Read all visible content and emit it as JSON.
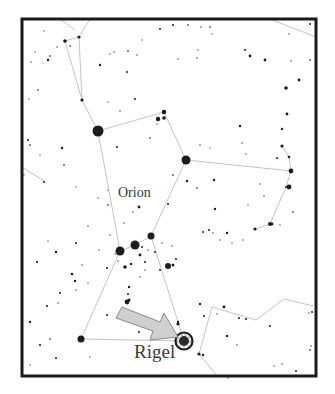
{
  "chart": {
    "constellation_label": "Orion",
    "highlight_label": "Rigel",
    "frame": {
      "x": 22,
      "y": 19,
      "width": 294,
      "height": 357,
      "stroke": "#1a1a1a",
      "stroke_width": 3
    },
    "colors": {
      "background": "#ffffff",
      "star": "#1c1c1c",
      "line": "#c4c4c4",
      "arrow_fill": "#cfcfcf",
      "arrow_stroke": "#8a8a8a",
      "label": "#3a3a3a"
    },
    "named_stars": [
      {
        "name": "Betelgeuse",
        "x": 98,
        "y": 131,
        "r": 5.5
      },
      {
        "name": "Bellatrix",
        "x": 186,
        "y": 160,
        "r": 4.5
      },
      {
        "name": "Meissa",
        "x": 164,
        "y": 112,
        "r": 2.2
      },
      {
        "name": "Alnitak",
        "x": 120,
        "y": 251,
        "r": 4.5
      },
      {
        "name": "Alnilam",
        "x": 135,
        "y": 245,
        "r": 4.5
      },
      {
        "name": "Mintaka",
        "x": 151,
        "y": 236,
        "r": 3.5
      },
      {
        "name": "Saiph",
        "x": 81,
        "y": 339,
        "r": 3.5
      },
      {
        "name": "Rigel",
        "x": 184,
        "y": 341,
        "r": 6.5
      }
    ]
  },
  "chart_data": {
    "type": "star_map",
    "title": "",
    "annotations": [
      "Orion",
      "Rigel"
    ],
    "highlighted_star": "Rigel",
    "lines": [
      [
        [
          65,
          41
        ],
        [
          79,
          37
        ]
      ],
      [
        [
          65,
          41
        ],
        [
          82,
          100
        ]
      ],
      [
        [
          79,
          37
        ],
        [
          82,
          100
        ]
      ],
      [
        [
          82,
          100
        ],
        [
          98,
          131
        ]
      ],
      [
        [
          98,
          131
        ],
        [
          164,
          112
        ]
      ],
      [
        [
          164,
          112
        ],
        [
          186,
          160
        ]
      ],
      [
        [
          98,
          131
        ],
        [
          120,
          251
        ]
      ],
      [
        [
          186,
          160
        ],
        [
          151,
          236
        ]
      ],
      [
        [
          186,
          160
        ],
        [
          291,
          171
        ]
      ],
      [
        [
          120,
          251
        ],
        [
          135,
          245
        ]
      ],
      [
        [
          135,
          245
        ],
        [
          151,
          236
        ]
      ],
      [
        [
          120,
          251
        ],
        [
          81,
          339
        ]
      ],
      [
        [
          151,
          236
        ],
        [
          184,
          341
        ]
      ],
      [
        [
          81,
          339
        ],
        [
          184,
          341
        ]
      ],
      [
        [
          282,
          146
        ],
        [
          289,
          157
        ]
      ],
      [
        [
          289,
          157
        ],
        [
          291,
          171
        ]
      ],
      [
        [
          291,
          171
        ],
        [
          286,
          187
        ]
      ],
      [
        [
          286,
          187
        ],
        [
          270,
          224
        ]
      ],
      [
        [
          270,
          224
        ],
        [
          255,
          229
        ]
      ],
      [
        [
          212,
          307
        ],
        [
          199,
          354
        ]
      ],
      [
        [
          199,
          354
        ],
        [
          218,
          377
        ]
      ],
      [
        [
          212,
          307
        ],
        [
          256,
          320
        ]
      ],
      [
        [
          256,
          320
        ],
        [
          284,
          299
        ]
      ],
      [
        [
          284,
          299
        ],
        [
          313,
          306
        ]
      ],
      [
        [
          22,
          167
        ],
        [
          44,
          181
        ]
      ],
      [
        [
          270,
          19
        ],
        [
          316,
          37
        ]
      ],
      [
        [
          60,
          19
        ],
        [
          75,
          30
        ]
      ],
      [
        [
          90,
          19
        ],
        [
          80,
          35
        ]
      ]
    ]
  }
}
